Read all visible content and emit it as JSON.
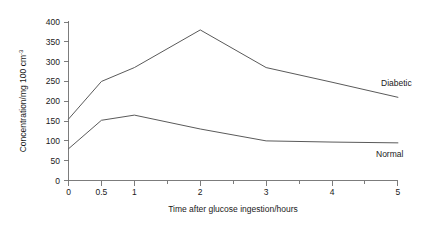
{
  "chart_data": {
    "type": "line",
    "title": "",
    "xlabel": "Time after glucose ingestion/hours",
    "ylabel": "Concentration/mg 100 cm",
    "ylabel_superscript": "-3",
    "xlim": [
      0,
      5
    ],
    "ylim": [
      0,
      400
    ],
    "x_ticks": [
      0,
      0.5,
      1,
      2,
      3,
      4,
      5
    ],
    "x_tick_labels": [
      "0",
      "0.5",
      "1",
      "2",
      "3",
      "4",
      "5"
    ],
    "x_minor_ticks": [
      1.5,
      2.5,
      3.5,
      4.5
    ],
    "y_ticks": [
      0,
      50,
      100,
      150,
      200,
      250,
      300,
      350,
      400
    ],
    "y_tick_labels": [
      "0",
      "50",
      "100",
      "150",
      "200",
      "250",
      "300",
      "350",
      "400"
    ],
    "grid": false,
    "legend_position": "inline-right",
    "line_color": "#5a5a5a",
    "series": [
      {
        "name": "Diabetic",
        "label": "Diabetic",
        "x": [
          0,
          0.5,
          1,
          2,
          3,
          4,
          5
        ],
        "values": [
          155,
          250,
          285,
          380,
          285,
          248,
          210
        ]
      },
      {
        "name": "Normal",
        "label": "Normal",
        "x": [
          0,
          0.5,
          1,
          2,
          3,
          4,
          5
        ],
        "values": [
          80,
          152,
          165,
          130,
          100,
          97,
          95
        ]
      }
    ],
    "annotations": [
      {
        "text": "Diabetic",
        "x": 4.45,
        "y": 235
      },
      {
        "text": "Normal",
        "x": 4.35,
        "y": 55
      }
    ]
  }
}
